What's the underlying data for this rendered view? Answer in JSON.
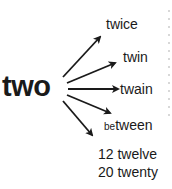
{
  "diagram": {
    "root": "two",
    "leaves": [
      {
        "id": "twice",
        "text": "twice"
      },
      {
        "id": "twin",
        "text": "twin"
      },
      {
        "id": "twain",
        "text": "twain"
      },
      {
        "id": "between",
        "prefix": "be",
        "text": "tween"
      },
      {
        "id": "twelve",
        "number": "12",
        "text": "twelve"
      },
      {
        "id": "twenty",
        "number": "20",
        "text": "twenty"
      }
    ],
    "colors": {
      "text": "#1a1a1a",
      "arrow": "#1a1a1a",
      "background": "#ffffff"
    }
  }
}
